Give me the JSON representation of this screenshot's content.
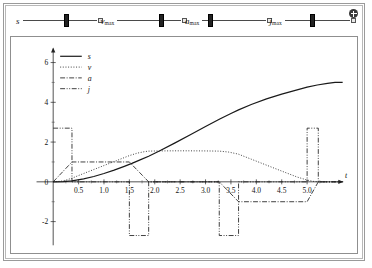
{
  "window": {
    "settings_icon": "gear-plus-icon"
  },
  "controls": {
    "sliders": [
      {
        "label": "s",
        "sub": "",
        "value_pos": 0.6
      },
      {
        "label": "v",
        "sub": "max",
        "value_pos": 0.7
      },
      {
        "label": "a",
        "sub": "max",
        "value_pos": 0.13
      },
      {
        "label": "j",
        "sub": "max",
        "value_pos": 0.42
      }
    ]
  },
  "chart_data": {
    "type": "line",
    "title": "",
    "xlabel": "t",
    "ylabel": "",
    "xlim": [
      -0.25,
      5.75
    ],
    "ylim": [
      -2.9,
      6.8
    ],
    "xticks": [
      0.5,
      1.0,
      1.5,
      2.0,
      2.5,
      3.0,
      3.5,
      4.0,
      4.5,
      5.0
    ],
    "xtick_labels": [
      "0.5",
      "1.0",
      "1.5",
      "2.0",
      "2.5",
      "3.0",
      "3.5",
      "4.0",
      "4.5",
      "5.0"
    ],
    "yticks": [
      -2,
      0,
      2,
      4,
      6
    ],
    "ytick_labels": [
      "-2",
      "0",
      "2",
      "4",
      "6"
    ],
    "yminor": [
      -1,
      1,
      3,
      5
    ],
    "grid": false,
    "legend_position": "upper-left",
    "series": [
      {
        "name": "s",
        "label": "s",
        "style": "solid",
        "points": [
          [
            0.0,
            0.0
          ],
          [
            0.2,
            0.008
          ],
          [
            0.37,
            0.05
          ],
          [
            0.6,
            0.15
          ],
          [
            0.8,
            0.27
          ],
          [
            1.0,
            0.42
          ],
          [
            1.2,
            0.59
          ],
          [
            1.4,
            0.78
          ],
          [
            1.55,
            0.93
          ],
          [
            1.7,
            1.09
          ],
          [
            1.88,
            1.29
          ],
          [
            2.1,
            1.56
          ],
          [
            2.4,
            1.96
          ],
          [
            2.7,
            2.37
          ],
          [
            3.0,
            2.78
          ],
          [
            3.28,
            3.16
          ],
          [
            3.5,
            3.44
          ],
          [
            3.65,
            3.62
          ],
          [
            3.9,
            3.89
          ],
          [
            4.2,
            4.17
          ],
          [
            4.5,
            4.41
          ],
          [
            4.75,
            4.59
          ],
          [
            5.0,
            4.76
          ],
          [
            5.2,
            4.87
          ],
          [
            5.4,
            4.95
          ],
          [
            5.55,
            5.0
          ],
          [
            5.7,
            5.0
          ]
        ]
      },
      {
        "name": "v",
        "label": "v",
        "style": "dotted",
        "points": [
          [
            0.0,
            0.0
          ],
          [
            0.15,
            0.03
          ],
          [
            0.25,
            0.085
          ],
          [
            0.37,
            0.185
          ],
          [
            0.6,
            0.42
          ],
          [
            0.9,
            0.72
          ],
          [
            1.2,
            1.02
          ],
          [
            1.5,
            1.32
          ],
          [
            1.65,
            1.44
          ],
          [
            1.8,
            1.52
          ],
          [
            1.88,
            1.545
          ],
          [
            2.1,
            1.555
          ],
          [
            2.4,
            1.56
          ],
          [
            2.7,
            1.56
          ],
          [
            3.0,
            1.555
          ],
          [
            3.27,
            1.545
          ],
          [
            3.45,
            1.5
          ],
          [
            3.6,
            1.42
          ],
          [
            3.65,
            1.39
          ],
          [
            3.9,
            1.14
          ],
          [
            4.2,
            0.84
          ],
          [
            4.5,
            0.54
          ],
          [
            4.8,
            0.245
          ],
          [
            5.0,
            0.09
          ],
          [
            5.12,
            0.025
          ],
          [
            5.22,
            0.0
          ],
          [
            5.4,
            0.0
          ],
          [
            5.7,
            0.0
          ]
        ]
      },
      {
        "name": "a",
        "label": "a",
        "style": "dashdot",
        "points": [
          [
            0.0,
            0.0
          ],
          [
            0.37,
            1.0
          ],
          [
            1.5,
            1.0
          ],
          [
            1.88,
            0.0
          ],
          [
            3.27,
            0.0
          ],
          [
            3.65,
            -1.0
          ],
          [
            5.0,
            -1.0
          ],
          [
            5.22,
            0.0
          ],
          [
            5.7,
            0.0
          ]
        ]
      },
      {
        "name": "j",
        "label": "j",
        "style": "dashdotdot",
        "points": [
          [
            0.0,
            2.7
          ],
          [
            0.37,
            2.7
          ],
          [
            0.37,
            0.0
          ],
          [
            1.5,
            0.0
          ],
          [
            1.5,
            -2.7
          ],
          [
            1.88,
            -2.7
          ],
          [
            1.88,
            0.0
          ],
          [
            3.27,
            0.0
          ],
          [
            3.27,
            -2.7
          ],
          [
            3.65,
            -2.7
          ],
          [
            3.65,
            0.0
          ],
          [
            5.0,
            0.0
          ],
          [
            5.0,
            2.7
          ],
          [
            5.22,
            2.7
          ],
          [
            5.22,
            0.0
          ],
          [
            5.7,
            0.0
          ]
        ]
      }
    ],
    "legend": [
      {
        "label": "s",
        "style": "solid"
      },
      {
        "label": "v",
        "style": "dotted"
      },
      {
        "label": "a",
        "style": "dashdot"
      },
      {
        "label": "j",
        "style": "dashdotdot"
      }
    ]
  }
}
